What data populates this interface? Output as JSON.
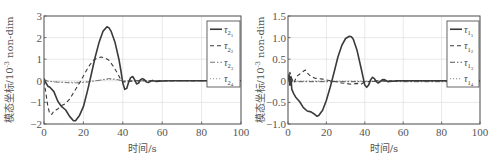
{
  "chart_data": [
    {
      "type": "line",
      "title": "",
      "xlabel": "时间/s",
      "ylabel": "模态坐标/10^-3 non-dim",
      "ylabel_main": "模态坐标/10",
      "ylabel_exp": "-3",
      "ylabel_unit": "non-dim",
      "xlim": [
        0,
        100
      ],
      "ylim": [
        -2,
        3
      ],
      "xticks": [
        0,
        20,
        40,
        60,
        80,
        100
      ],
      "yticks": [
        -2,
        -1,
        0,
        1,
        2,
        3
      ],
      "ytick_labels": [
        "−2",
        "−1",
        "0",
        "1",
        "2",
        "3"
      ],
      "grid": true,
      "legend_position": "upper right",
      "series": [
        {
          "name": "τ21",
          "sym": "τ",
          "sub": "2",
          "subsub": "1",
          "style": "solid",
          "x": [
            0,
            1,
            2,
            3,
            5,
            7,
            9,
            11,
            13,
            15,
            16,
            18,
            20,
            22,
            24,
            26,
            28,
            30,
            32,
            33,
            34,
            36,
            38,
            39,
            40,
            41,
            42,
            43,
            44,
            45,
            46,
            47,
            48,
            49,
            50,
            51,
            52,
            53,
            55,
            57,
            60,
            65,
            70,
            80,
            90,
            100
          ],
          "y": [
            0.1,
            -0.1,
            -0.25,
            -0.3,
            -0.5,
            -0.95,
            -1.2,
            -1.35,
            -1.65,
            -1.85,
            -1.85,
            -1.6,
            -1.2,
            -0.5,
            0.3,
            1.1,
            1.8,
            2.3,
            2.5,
            2.45,
            2.3,
            1.8,
            1.0,
            0.5,
            -0.1,
            -0.4,
            -0.35,
            -0.05,
            0.15,
            0.2,
            0.05,
            -0.15,
            -0.1,
            0.05,
            0.1,
            0.05,
            -0.05,
            -0.08,
            0.02,
            -0.03,
            -0.01,
            0.0,
            0.0,
            0.0,
            0.0,
            0.0
          ]
        },
        {
          "name": "τ22",
          "sym": "τ",
          "sub": "2",
          "subsub": "2",
          "style": "dashed",
          "x": [
            0,
            1,
            2,
            3,
            4,
            5,
            7,
            9,
            11,
            13,
            15,
            17,
            19,
            21,
            23,
            25,
            27,
            29,
            31,
            33,
            35,
            37,
            39,
            40,
            42,
            45,
            50,
            60,
            100
          ],
          "y": [
            0.0,
            -0.6,
            -1.2,
            -1.55,
            -1.55,
            -1.4,
            -1.3,
            -1.15,
            -1.05,
            -0.85,
            -0.55,
            -0.25,
            0.05,
            0.4,
            0.7,
            0.95,
            1.05,
            1.1,
            1.05,
            0.95,
            0.7,
            0.4,
            0.05,
            -0.05,
            -0.05,
            0.0,
            0.0,
            0.0,
            0.0
          ]
        },
        {
          "name": "τ23",
          "sym": "τ",
          "sub": "2",
          "subsub": "3",
          "style": "dashdot",
          "x": [
            0,
            2,
            5,
            10,
            15,
            20,
            25,
            30,
            33,
            36,
            40,
            45,
            50,
            60,
            100
          ],
          "y": [
            0.05,
            -0.02,
            -0.05,
            -0.08,
            -0.1,
            -0.08,
            -0.02,
            0.05,
            0.1,
            0.08,
            0.0,
            -0.02,
            0.0,
            0.0,
            0.0
          ],
          "color": "#777777"
        },
        {
          "name": "τ24",
          "sym": "τ",
          "sub": "2",
          "subsub": "4",
          "style": "dotted",
          "x": [
            0,
            2,
            5,
            10,
            15,
            20,
            25,
            30,
            33,
            36,
            40,
            45,
            50,
            60,
            100
          ],
          "y": [
            0.0,
            -0.02,
            -0.04,
            -0.06,
            -0.07,
            -0.05,
            -0.01,
            0.04,
            0.07,
            0.05,
            0.0,
            0.0,
            0.0,
            0.0,
            0.0
          ],
          "color": "#999999"
        }
      ]
    },
    {
      "type": "line",
      "title": "",
      "xlabel": "时间/s",
      "ylabel": "模态坐标/10^-3 non-dim",
      "ylabel_main": "模态坐标/10",
      "ylabel_exp": "-3",
      "ylabel_unit": "non-dim",
      "xlim": [
        0,
        100
      ],
      "ylim": [
        -1.0,
        1.5
      ],
      "xticks": [
        0,
        20,
        40,
        60,
        80,
        100
      ],
      "yticks": [
        -1.0,
        -0.5,
        0,
        0.5,
        1.0,
        1.5
      ],
      "ytick_labels": [
        "−1.0",
        "−0.5",
        "0",
        "0.5",
        "1.0",
        "1.5"
      ],
      "grid": true,
      "legend_position": "upper right",
      "series": [
        {
          "name": "τ11",
          "sym": "τ",
          "sub": "1",
          "subsub": "1",
          "style": "solid",
          "x": [
            0,
            0.5,
            1,
            1.5,
            2,
            3,
            4,
            6,
            8,
            10,
            12,
            14,
            15,
            16,
            18,
            20,
            22,
            24,
            26,
            28,
            30,
            32,
            33,
            34,
            36,
            38,
            40,
            41,
            42,
            43,
            44,
            45,
            46,
            47,
            48,
            49,
            50,
            51,
            52,
            54,
            57,
            60,
            70,
            80,
            90,
            100
          ],
          "y": [
            0.0,
            0.15,
            -0.1,
            0.1,
            -0.2,
            -0.3,
            -0.38,
            -0.48,
            -0.62,
            -0.7,
            -0.72,
            -0.78,
            -0.82,
            -0.8,
            -0.68,
            -0.45,
            -0.15,
            0.2,
            0.55,
            0.82,
            0.98,
            1.03,
            1.02,
            0.96,
            0.7,
            0.3,
            -0.1,
            -0.15,
            -0.1,
            0.02,
            0.08,
            0.05,
            -0.02,
            -0.05,
            -0.02,
            0.02,
            0.03,
            0.01,
            -0.02,
            -0.01,
            0.0,
            0.0,
            0.0,
            0.0,
            0.0,
            0.0
          ]
        },
        {
          "name": "τ12",
          "sym": "τ",
          "sub": "1",
          "subsub": "2",
          "style": "dashed",
          "x": [
            0,
            1,
            2,
            3,
            4,
            5,
            6,
            8,
            9,
            10,
            12,
            14,
            16,
            18,
            20,
            25,
            28,
            30,
            33,
            36,
            38,
            40,
            45,
            50,
            60,
            100
          ],
          "y": [
            0.0,
            0.2,
            0.05,
            -0.05,
            0.05,
            0.12,
            0.15,
            0.22,
            0.25,
            0.18,
            0.1,
            0.06,
            0.05,
            0.04,
            0.02,
            -0.02,
            -0.05,
            -0.06,
            -0.08,
            -0.06,
            -0.08,
            -0.03,
            0.0,
            0.0,
            0.0,
            0.0
          ]
        },
        {
          "name": "τ13",
          "sym": "τ",
          "sub": "1",
          "subsub": "3",
          "style": "dashdot",
          "x": [
            0,
            2,
            5,
            10,
            20,
            30,
            40,
            50,
            60,
            100
          ],
          "y": [
            0.0,
            -0.02,
            -0.02,
            -0.02,
            -0.02,
            -0.02,
            -0.02,
            -0.01,
            -0.02,
            -0.02
          ],
          "color": "#555555"
        },
        {
          "name": "τ14",
          "sym": "τ",
          "sub": "1",
          "subsub": "4",
          "style": "dotted",
          "x": [
            0,
            2,
            5,
            10,
            20,
            30,
            40,
            50,
            60,
            100
          ],
          "y": [
            0.0,
            -0.01,
            -0.01,
            -0.01,
            -0.01,
            -0.01,
            -0.01,
            -0.01,
            -0.01,
            -0.01
          ],
          "color": "#888888"
        }
      ]
    }
  ],
  "layout": {
    "panels": [
      {
        "offset_x": 0,
        "plot": {
          "left": 44,
          "top": 16,
          "right": 241,
          "bottom": 124
        },
        "legend": {
          "left": 207,
          "top": 21,
          "right": 240,
          "bottom": 87
        }
      },
      {
        "offset_x": 251,
        "plot": {
          "left": 37,
          "top": 16,
          "right": 229,
          "bottom": 124
        },
        "legend": {
          "left": 196,
          "top": 21,
          "right": 228,
          "bottom": 87
        }
      }
    ]
  },
  "colors": {
    "line": "#3a3a3a",
    "axis": "#555555",
    "grid": "#d9d9d9",
    "text": "#555555"
  }
}
